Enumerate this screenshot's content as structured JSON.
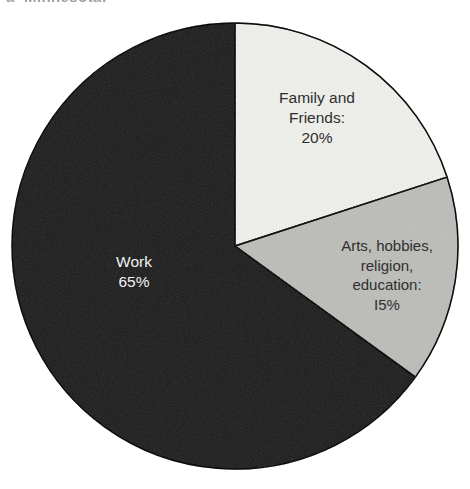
{
  "page": {
    "background_color": "#ffffff",
    "width": 470,
    "height": 489
  },
  "top_cut_text": {
    "fragment_1": "a",
    "fragment_2": "Minnesota:"
  },
  "chart_data": {
    "type": "pie",
    "title": "",
    "subtitle": "",
    "xlabel": "",
    "ylabel": "",
    "legend_position": "none",
    "grid": false,
    "units": "percent",
    "total": 100,
    "start_angle_deg": 0,
    "direction": "clockwise",
    "categories": [
      "Family and Friends",
      "Arts, hobbies, religion, education",
      "Work"
    ],
    "values": [
      20,
      15,
      65
    ],
    "slices": [
      {
        "name": "Family and Friends",
        "value": 20,
        "value_label": "20%",
        "label_text": "Family and\nFriends:\n20%",
        "color": "#f7f7f5",
        "stroke": "#3a3a3a",
        "text_color": "#2f2f2f",
        "start_angle_deg": 0,
        "end_angle_deg": 72
      },
      {
        "name": "Arts, hobbies, religion, education",
        "value": 15,
        "value_label": "I5%",
        "label_text": "Arts, hobbies,\nreligion,\neducation:\nI5%",
        "color": "#dcdcda",
        "stroke": "#3a3a3a",
        "text_color": "#2f2f2f",
        "start_angle_deg": 72,
        "end_angle_deg": 126
      },
      {
        "name": "Work",
        "value": 65,
        "value_label": "65%",
        "label_text": "Work\n65%",
        "color": "#5c5c5c",
        "stroke": "#2a2a2a",
        "text_color": "#f2f2f2",
        "start_angle_deg": 126,
        "end_angle_deg": 360
      }
    ],
    "geometry": {
      "center_x": 235,
      "center_y": 246,
      "radius": 223
    }
  }
}
